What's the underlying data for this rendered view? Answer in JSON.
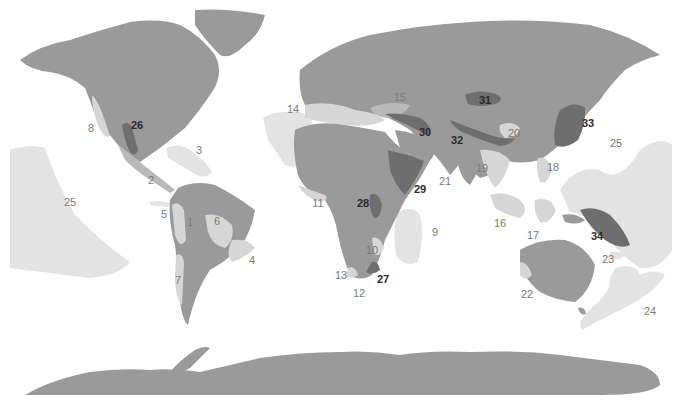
{
  "map": {
    "type": "world-region-map",
    "colors": {
      "background": "#ffffff",
      "land": "#9a9a9a",
      "light_region": "#d6d6d6",
      "medium_region": "#b9b9b9",
      "dark_region": "#6e6e6e",
      "ocean_region": "#e3e3e3",
      "light_label": "#7a7a7a",
      "dark_label": "#2b2b2b"
    },
    "labels": [
      {
        "id": "1",
        "text": "1",
        "x": 190,
        "y": 222,
        "style": "light"
      },
      {
        "id": "2",
        "text": "2",
        "x": 151,
        "y": 180,
        "style": "light"
      },
      {
        "id": "3",
        "text": "3",
        "x": 199,
        "y": 150,
        "style": "light"
      },
      {
        "id": "4",
        "text": "4",
        "x": 252,
        "y": 260,
        "style": "light"
      },
      {
        "id": "5",
        "text": "5",
        "x": 164,
        "y": 214,
        "style": "light"
      },
      {
        "id": "6",
        "text": "6",
        "x": 217,
        "y": 221,
        "style": "light"
      },
      {
        "id": "7",
        "text": "7",
        "x": 178,
        "y": 280,
        "style": "light"
      },
      {
        "id": "8",
        "text": "8",
        "x": 91,
        "y": 128,
        "style": "light"
      },
      {
        "id": "9",
        "text": "9",
        "x": 435,
        "y": 232,
        "style": "light"
      },
      {
        "id": "10",
        "text": "10",
        "x": 372,
        "y": 250,
        "style": "light"
      },
      {
        "id": "11",
        "text": "11",
        "x": 318,
        "y": 203,
        "style": "light"
      },
      {
        "id": "12",
        "text": "12",
        "x": 359,
        "y": 293,
        "style": "light"
      },
      {
        "id": "13",
        "text": "13",
        "x": 341,
        "y": 275,
        "style": "light"
      },
      {
        "id": "14",
        "text": "14",
        "x": 293,
        "y": 109,
        "style": "light"
      },
      {
        "id": "15",
        "text": "15",
        "x": 400,
        "y": 97,
        "style": "light"
      },
      {
        "id": "16",
        "text": "16",
        "x": 500,
        "y": 223,
        "style": "light"
      },
      {
        "id": "17",
        "text": "17",
        "x": 533,
        "y": 235,
        "style": "light"
      },
      {
        "id": "18",
        "text": "18",
        "x": 553,
        "y": 167,
        "style": "light"
      },
      {
        "id": "19",
        "text": "19",
        "x": 482,
        "y": 168,
        "style": "light"
      },
      {
        "id": "20",
        "text": "20",
        "x": 514,
        "y": 133,
        "style": "light"
      },
      {
        "id": "21",
        "text": "21",
        "x": 445,
        "y": 181,
        "style": "light"
      },
      {
        "id": "22",
        "text": "22",
        "x": 527,
        "y": 294,
        "style": "light"
      },
      {
        "id": "23",
        "text": "23",
        "x": 608,
        "y": 259,
        "style": "light"
      },
      {
        "id": "24",
        "text": "24",
        "x": 650,
        "y": 311,
        "style": "light"
      },
      {
        "id": "25",
        "text": "25",
        "x": 616,
        "y": 143,
        "style": "light"
      },
      {
        "id": "25b",
        "text": "25",
        "x": 70,
        "y": 202,
        "style": "light"
      },
      {
        "id": "26",
        "text": "26",
        "x": 137,
        "y": 125,
        "style": "dark"
      },
      {
        "id": "27",
        "text": "27",
        "x": 383,
        "y": 279,
        "style": "dark"
      },
      {
        "id": "28",
        "text": "28",
        "x": 363,
        "y": 203,
        "style": "dark"
      },
      {
        "id": "29",
        "text": "29",
        "x": 420,
        "y": 189,
        "style": "dark"
      },
      {
        "id": "30",
        "text": "30",
        "x": 425,
        "y": 132,
        "style": "dark"
      },
      {
        "id": "31",
        "text": "31",
        "x": 485,
        "y": 100,
        "style": "dark"
      },
      {
        "id": "32",
        "text": "32",
        "x": 457,
        "y": 140,
        "style": "dark"
      },
      {
        "id": "33",
        "text": "33",
        "x": 588,
        "y": 123,
        "style": "dark"
      },
      {
        "id": "34",
        "text": "34",
        "x": 597,
        "y": 236,
        "style": "dark"
      }
    ]
  }
}
